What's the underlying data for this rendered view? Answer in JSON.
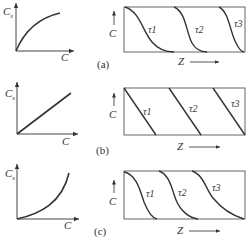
{
  "panels": [
    {
      "id": "a",
      "caption": "(a)",
      "isotherm": {
        "shape": "favorable (concave)",
        "y_label": "C",
        "y_sub": "s",
        "x_label": "C"
      },
      "profiles": {
        "y_label": "C",
        "x_label": "Z",
        "curves": [
          "τ1",
          "τ2",
          "τ3"
        ],
        "shape": "self-sharpening S-curve"
      }
    },
    {
      "id": "b",
      "caption": "(b)",
      "isotherm": {
        "shape": "linear",
        "y_label": "C",
        "y_sub": "s",
        "x_label": "C"
      },
      "profiles": {
        "y_label": "C",
        "x_label": "Z",
        "curves": [
          "τ1",
          "τ2",
          "τ3"
        ],
        "shape": "constant straight front"
      }
    },
    {
      "id": "c",
      "caption": "(c)",
      "isotherm": {
        "shape": "unfavorable (convex)",
        "y_label": "C",
        "y_sub": "s",
        "x_label": "C"
      },
      "profiles": {
        "y_label": "C",
        "x_label": "Z",
        "curves": [
          "τ1",
          "τ2",
          "τ3"
        ],
        "shape": "spreading S-curve"
      }
    }
  ]
}
